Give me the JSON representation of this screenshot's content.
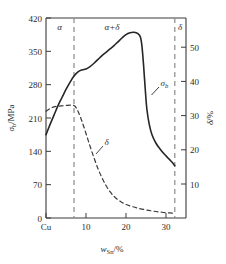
{
  "chart_data": {
    "type": "line",
    "title": "",
    "xlabel": "w_Sn/%",
    "xlabel_main": "w",
    "xlabel_sub": "Sn",
    "xlabel_tail": "/%",
    "ylabel_left": "σ_b/MPa",
    "ylabel_left_main": "σ",
    "ylabel_left_sub": "b",
    "ylabel_left_tail": "/MPa",
    "ylabel_right": "δ/%",
    "ylabel_right_main": "δ",
    "ylabel_right_tail": "/%",
    "xlim": [
      0,
      35
    ],
    "ylim_left": [
      0,
      420
    ],
    "ylim_right": [
      0,
      59.2
    ],
    "grid": false,
    "legend": "inline-annotations",
    "x_ticks": [
      0,
      10,
      20,
      30
    ],
    "x_tick_labels": [
      "Cu",
      "10",
      "20",
      "30"
    ],
    "y_ticks_left": [
      0,
      70,
      140,
      210,
      280,
      350,
      420
    ],
    "y_tick_labels_left": [
      "0",
      "70",
      "140",
      "210",
      "280",
      "350",
      "420"
    ],
    "y_ticks_right": [
      10,
      20,
      30,
      40,
      50
    ],
    "y_tick_labels_right": [
      "10",
      "20",
      "30",
      "40",
      "50"
    ],
    "phase_regions": [
      {
        "label": "α",
        "x_center": 3.4
      },
      {
        "label": "α+δ",
        "x_center": 16.5
      },
      {
        "label": "δ",
        "x_center": 33.2
      }
    ],
    "phase_boundaries": [
      7.0,
      32.2
    ],
    "series": [
      {
        "name": "σb",
        "label": "σ_b",
        "label_main": "σ",
        "label_sub": "b",
        "style": "solid",
        "axis": "left",
        "points": [
          [
            0,
            175
          ],
          [
            1.0,
            196
          ],
          [
            2.0,
            216
          ],
          [
            3.0,
            236
          ],
          [
            4.0,
            253
          ],
          [
            5.0,
            270
          ],
          [
            6.0,
            285
          ],
          [
            7.0,
            298
          ],
          [
            8.0,
            307
          ],
          [
            9.0,
            311
          ],
          [
            10.0,
            313
          ],
          [
            11.0,
            318
          ],
          [
            12.0,
            325
          ],
          [
            13.0,
            333
          ],
          [
            14.0,
            341
          ],
          [
            15.0,
            348
          ],
          [
            16.0,
            355
          ],
          [
            17.0,
            362
          ],
          [
            18.0,
            370
          ],
          [
            19.0,
            378
          ],
          [
            20.0,
            385
          ],
          [
            21.0,
            389
          ],
          [
            22.0,
            390
          ],
          [
            23.0,
            387
          ],
          [
            23.6,
            380
          ],
          [
            24.0,
            360
          ],
          [
            24.4,
            320
          ],
          [
            24.8,
            272
          ],
          [
            25.2,
            230
          ],
          [
            25.8,
            197
          ],
          [
            26.5,
            175
          ],
          [
            27.5,
            157
          ],
          [
            28.5,
            145
          ],
          [
            29.5,
            135
          ],
          [
            30.5,
            126
          ],
          [
            31.4,
            118
          ],
          [
            32.2,
            110
          ]
        ],
        "annotation": {
          "text": "σ_b",
          "x": 27.2,
          "y": 345
        }
      },
      {
        "name": "δ",
        "label": "δ",
        "label_main": "δ",
        "style": "dashed",
        "axis": "right",
        "points": [
          [
            0,
            31.6
          ],
          [
            1.0,
            32.4
          ],
          [
            2.0,
            32.9
          ],
          [
            3.0,
            33.1
          ],
          [
            4.0,
            33.2
          ],
          [
            5.0,
            33.3
          ],
          [
            6.0,
            33.4
          ],
          [
            6.7,
            33.4
          ],
          [
            7.3,
            33.0
          ],
          [
            8.0,
            31.6
          ],
          [
            9.0,
            28.6
          ],
          [
            10.0,
            25.0
          ],
          [
            11.0,
            21.3
          ],
          [
            12.0,
            17.8
          ],
          [
            13.0,
            14.6
          ],
          [
            14.0,
            11.9
          ],
          [
            15.0,
            9.6
          ],
          [
            16.0,
            7.8
          ],
          [
            17.0,
            6.4
          ],
          [
            18.0,
            5.4
          ],
          [
            19.0,
            4.6
          ],
          [
            20.0,
            4.0
          ],
          [
            21.5,
            3.4
          ],
          [
            23.0,
            2.9
          ],
          [
            25.0,
            2.4
          ],
          [
            27.0,
            2.0
          ],
          [
            29.0,
            1.7
          ],
          [
            31.0,
            1.5
          ],
          [
            32.2,
            1.4
          ]
        ],
        "annotation": {
          "text": "δ",
          "x": 13.4,
          "y_left": 161
        }
      }
    ]
  },
  "figure": {
    "alt": "Tensile strength and elongation of Cu-Sn alloy versus tin content",
    "colors": {
      "curve": "#262626",
      "boundary": "#8a8a8a",
      "axis": "#3a3a3a",
      "text": "#2a2a2a",
      "background": "#ffffff"
    }
  }
}
